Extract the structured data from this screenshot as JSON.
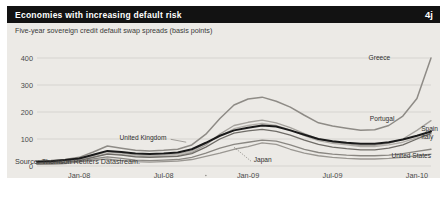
{
  "header": {
    "title": "Economies with increasing default risk",
    "badge": "4j",
    "title_bg": "#121212",
    "title_color": "#ffffff"
  },
  "figure": {
    "background": "#eceae6",
    "subtitle": "Five-year sovereign credit default swap spreads (basis points)",
    "source": "Source: Thomson Reuters Datastream."
  },
  "chart_data": {
    "type": "line",
    "title": "Economies with increasing default risk",
    "subtitle": "Five-year sovereign credit default swap spreads (basis points)",
    "xlabel": "",
    "ylabel": "basis points",
    "ylim": [
      0,
      400
    ],
    "yticks": [
      0,
      100,
      200,
      300,
      400
    ],
    "xticks": [
      "Jan-08",
      "Jul-08",
      "Jan-09",
      "Jul-09",
      "Jan-10"
    ],
    "xtick_positions": [
      3,
      9,
      15,
      21,
      27
    ],
    "grid": true,
    "legend_position": "inline-right",
    "x": [
      0,
      1,
      2,
      3,
      4,
      5,
      6,
      7,
      8,
      9,
      10,
      11,
      12,
      13,
      14,
      15,
      16,
      17,
      18,
      19,
      20,
      21,
      22,
      23,
      24,
      25,
      26,
      27,
      28
    ],
    "x_labels": [
      "Oct-07",
      "Nov-07",
      "Dec-07",
      "Jan-08",
      "Feb-08",
      "Mar-08",
      "Apr-08",
      "May-08",
      "Jun-08",
      "Jul-08",
      "Aug-08",
      "Sep-08",
      "Oct-08",
      "Nov-08",
      "Dec-08",
      "Jan-09",
      "Feb-09",
      "Mar-09",
      "Apr-09",
      "May-09",
      "Jun-09",
      "Jul-09",
      "Aug-09",
      "Sep-09",
      "Oct-09",
      "Nov-09",
      "Dec-09",
      "Jan-10",
      "Feb-10"
    ],
    "series": [
      {
        "name": "Greece",
        "color": "#8e8b86",
        "width": 1.5,
        "label_x": 27.0,
        "label_y": 390,
        "values": [
          18,
          20,
          24,
          32,
          52,
          74,
          66,
          58,
          56,
          58,
          62,
          78,
          118,
          176,
          226,
          248,
          255,
          240,
          218,
          188,
          160,
          148,
          140,
          132,
          134,
          150,
          185,
          250,
          400
        ]
      },
      {
        "name": "Portugal",
        "color": "#a5a29d",
        "width": 1.3,
        "label_x": 25.2,
        "label_y": 176,
        "values": [
          10,
          12,
          15,
          20,
          34,
          46,
          42,
          36,
          34,
          36,
          38,
          50,
          78,
          118,
          150,
          162,
          170,
          160,
          142,
          120,
          100,
          88,
          82,
          76,
          76,
          84,
          100,
          132,
          168
        ]
      },
      {
        "name": "Spain",
        "color": "#6f6c67",
        "width": 1.3,
        "label_x": 27.6,
        "label_y": 126,
        "values": [
          9,
          11,
          14,
          20,
          32,
          44,
          40,
          34,
          32,
          34,
          36,
          46,
          70,
          100,
          122,
          130,
          136,
          128,
          114,
          96,
          80,
          70,
          64,
          60,
          60,
          66,
          78,
          100,
          122
        ]
      },
      {
        "name": "Italy",
        "color": "#1a1a1a",
        "width": 2.0,
        "label_x": 27.6,
        "label_y": 108,
        "values": [
          16,
          18,
          22,
          28,
          42,
          56,
          52,
          46,
          44,
          46,
          50,
          62,
          86,
          112,
          132,
          142,
          150,
          146,
          132,
          116,
          100,
          92,
          86,
          82,
          82,
          88,
          98,
          112,
          128
        ]
      },
      {
        "name": "United States",
        "color": "#9a9792",
        "width": 1.3,
        "label_x": 25.0,
        "label_y": 34,
        "values": [
          6,
          7,
          9,
          14,
          22,
          26,
          20,
          16,
          14,
          16,
          18,
          24,
          36,
          48,
          62,
          72,
          86,
          80,
          62,
          48,
          38,
          32,
          28,
          26,
          26,
          28,
          32,
          38,
          44
        ]
      },
      {
        "name": "United Kingdom",
        "color": "#b2afaa",
        "width": 1.3,
        "label_x": 8.6,
        "label_y": 96,
        "values": [
          12,
          14,
          18,
          24,
          38,
          52,
          48,
          40,
          38,
          40,
          44,
          56,
          84,
          112,
          138,
          150,
          158,
          150,
          134,
          112,
          94,
          84,
          78,
          72,
          72,
          78,
          88,
          104,
          118
        ]
      },
      {
        "name": "Japan",
        "color": "#8a8782",
        "width": 1.3,
        "label_x": 16.2,
        "label_y": 22,
        "values": [
          7,
          8,
          10,
          16,
          26,
          34,
          28,
          22,
          20,
          22,
          24,
          32,
          48,
          66,
          80,
          88,
          96,
          92,
          78,
          62,
          50,
          44,
          40,
          38,
          38,
          40,
          46,
          54,
          62
        ]
      }
    ],
    "annotations": [
      {
        "name": "united-kingdom-label",
        "text": "United Kingdom",
        "anchor": "end"
      },
      {
        "name": "japan-label",
        "text": "Japan",
        "anchor": "start"
      },
      {
        "name": "greece-label",
        "text": "Greece",
        "anchor": "end"
      },
      {
        "name": "portugal-label",
        "text": "Portugal",
        "anchor": "end"
      },
      {
        "name": "spain-label",
        "text": "Spain",
        "anchor": "start"
      },
      {
        "name": "italy-label",
        "text": "Italy",
        "anchor": "start"
      },
      {
        "name": "united-states-label",
        "text": "United States",
        "anchor": "end"
      }
    ]
  },
  "labels": {
    "greece": "Greece",
    "portugal": "Portugal",
    "spain": "Spain",
    "italy": "Italy",
    "united_states": "United States",
    "united_kingdom": "United Kingdom",
    "japan": "Japan"
  },
  "axis": {
    "y": [
      "400",
      "300",
      "200",
      "100",
      "0"
    ],
    "x": [
      "Jan-08",
      "Jul-08",
      "Jan-09",
      "Jul-09",
      "Jan-10"
    ]
  }
}
